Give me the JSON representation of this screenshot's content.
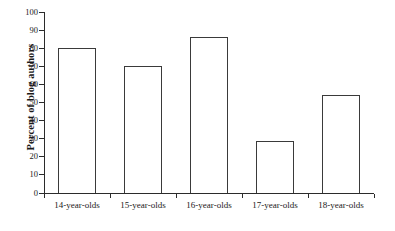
{
  "chart_data": {
    "type": "bar",
    "title": "",
    "xlabel": "",
    "ylabel": "Percent of blog authors",
    "categories": [
      "14-year-olds",
      "15-year-olds",
      "16-year-olds",
      "17-year-olds",
      "18-year-olds"
    ],
    "values": [
      80,
      70,
      86,
      29,
      54
    ],
    "ylim": [
      0,
      100
    ],
    "ytick_step": 10,
    "yticks": [
      "0",
      "10",
      "20",
      "30",
      "40",
      "50",
      "60",
      "70",
      "80",
      "90",
      "100"
    ],
    "grid": false,
    "legend": null,
    "bar_fill_color": "#ffffff",
    "bar_edge_color": "#3a3a3a",
    "axis_color": "#2b2b2b",
    "background_color": "#ffffff"
  }
}
